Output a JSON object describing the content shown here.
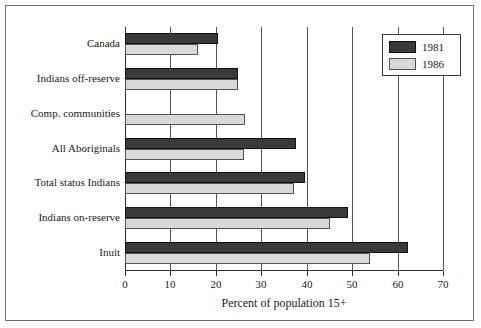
{
  "chart_data": {
    "type": "bar",
    "orientation": "horizontal",
    "title": "",
    "xlabel": "Percent of population 15+",
    "ylabel": "",
    "xlim": [
      0,
      70
    ],
    "xticks": [
      0,
      10,
      20,
      30,
      40,
      50,
      60,
      70
    ],
    "xticklabels": [
      "0",
      "10",
      "20",
      "30",
      "40",
      "50",
      "60",
      "70"
    ],
    "grid": "vertical",
    "legend_position": "upper right",
    "categories": [
      "Canada",
      "Indians off-reserve",
      "Comp. communities",
      "All Aboriginals",
      "Total status Indians",
      "Indians on-reserve",
      "Inuit"
    ],
    "series": [
      {
        "name": "1981",
        "color": "#3a3a3a",
        "values": [
          20.5,
          24.8,
          null,
          37.6,
          39.6,
          49.1,
          62.3
        ]
      },
      {
        "name": "1986",
        "color": "#d9d9d9",
        "values": [
          16.1,
          24.8,
          26.4,
          26.3,
          37.2,
          45.1,
          54.0
        ]
      }
    ]
  },
  "legend": {
    "items": [
      {
        "label": "1981",
        "color": "#3a3a3a"
      },
      {
        "label": "1986",
        "color": "#d9d9d9"
      }
    ]
  },
  "axis": {
    "xlabel": "Percent of population 15+"
  },
  "colors": {
    "series_1981": "#3a3a3a",
    "series_1986": "#d9d9d9",
    "frame": "#6f6f6f",
    "axis": "#2b2b2b",
    "gridline": "#555555",
    "background": "#ffffff"
  }
}
